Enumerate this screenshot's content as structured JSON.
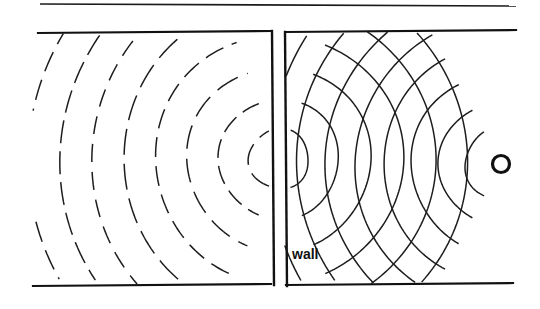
{
  "figure": {
    "background_color": "#ffffff",
    "ink_color": "#111111",
    "width": 540,
    "height": 309,
    "labels": {
      "wall": "wall"
    },
    "top_rule": {
      "x1": 40,
      "y1": 4,
      "x2": 516,
      "y2": 6,
      "stroke_width": 1.6
    },
    "chamber_border": {
      "top": {
        "x1": 38,
        "y1": 33,
        "x2": 271,
        "y2": 31,
        "stroke_width": 2.2
      },
      "bottom": {
        "x1": 33,
        "y1": 286,
        "x2": 271,
        "y2": 284,
        "stroke_width": 2.2
      },
      "top_right": {
        "x1": 286,
        "y1": 32,
        "x2": 516,
        "y2": 30,
        "stroke_width": 2.2
      },
      "bottom_right": {
        "x1": 286,
        "y1": 285,
        "x2": 513,
        "y2": 283,
        "stroke_width": 2.2
      }
    },
    "wall_segments": [
      {
        "name": "wall-left-edge",
        "x1": 272,
        "y1": 31,
        "x2": 274,
        "y2": 285,
        "stroke_width": 2.4
      },
      {
        "name": "wall-right-edge",
        "x1": 285,
        "y1": 32,
        "x2": 287,
        "y2": 286,
        "stroke_width": 2.4
      }
    ],
    "aperture": {
      "center_x": 279,
      "center_y": 159,
      "gap_top_y": 31,
      "gap_bottom_y": 286
    },
    "source": {
      "name": "point-source",
      "center_x": 501,
      "center_y": 164,
      "outer_radius": 8.5,
      "stroke_width": 3.2
    },
    "wall_label_pos": {
      "x": 292,
      "y": 259
    }
  },
  "chart_data": {
    "type": "line",
    "xlabel": "",
    "ylabel": "",
    "grid": false,
    "legend": null,
    "xlim": [
      0,
      540
    ],
    "ylim": [
      0,
      309
    ],
    "annotations": [
      {
        "text": "wall",
        "x": 292,
        "y": 259
      }
    ],
    "series": [
      {
        "name": "incident-circular-wavefronts",
        "style": "solid",
        "description": "Concentric arcs radiating from the point source on the right, travelling left toward the wall",
        "center": [
          501,
          164
        ],
        "radii": [
          36,
          62,
          90,
          118,
          146,
          175,
          204,
          232,
          260
        ],
        "angle_span_deg": [
          118,
          242
        ]
      },
      {
        "name": "diffracted-wavefronts-left",
        "style": "dashed",
        "description": "Dashed circular wavefronts spreading from the aperture into the left chamber",
        "center": [
          279,
          159
        ],
        "radii": [
          30,
          60,
          92,
          124,
          156,
          188,
          219,
          250
        ],
        "angle_span_deg": [
          110,
          250
        ]
      },
      {
        "name": "diffracted-wavefronts-right",
        "style": "solid",
        "description": "Secondary circular wavefronts spreading back from the aperture into the right chamber, crossing the incident waves",
        "center": [
          279,
          159
        ],
        "radii": [
          30,
          60,
          92,
          124,
          156,
          188
        ],
        "angle_span_deg": [
          -68,
          68
        ]
      }
    ]
  }
}
